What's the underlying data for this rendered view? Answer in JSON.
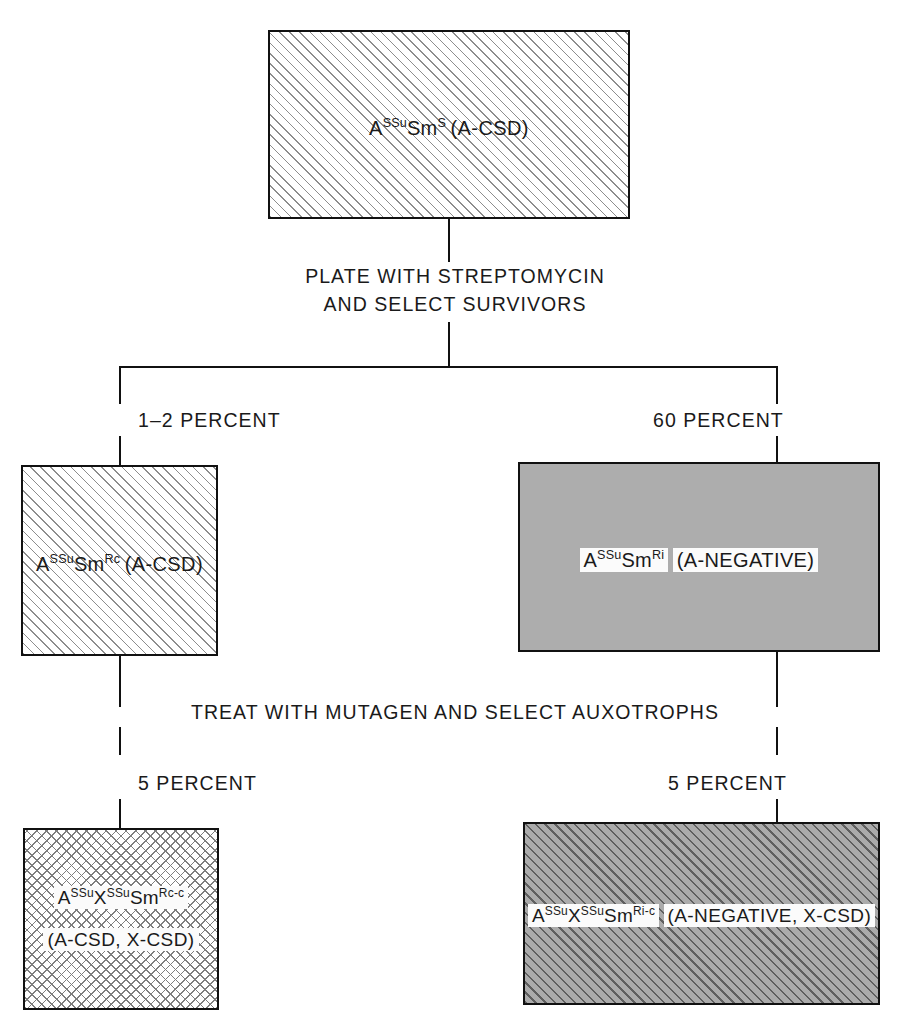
{
  "diagram": {
    "colors": {
      "line": "#111111",
      "hatch": "#8d8d8d",
      "gray_fill": "#adadad",
      "dark_hatch": "#5f5f5f",
      "text": "#1a1a1a"
    },
    "nodes": {
      "top": {
        "genotype_base": "A",
        "genotype_sup1": "SSu",
        "genotype_mid": "Sm",
        "genotype_sup2": "S",
        "phenotype": "(A-CSD)",
        "fill": "hatch"
      },
      "mid_left": {
        "genotype_base": "A",
        "genotype_sup1": "SSu",
        "genotype_mid": "Sm",
        "genotype_sup2": "Rc",
        "phenotype": "(A-CSD)",
        "fill": "hatch"
      },
      "mid_right": {
        "genotype_base": "A",
        "genotype_sup1": "SSu",
        "genotype_mid": "Sm",
        "genotype_sup2": "Ri",
        "phenotype": "(A-NEGATIVE)",
        "fill": "gray"
      },
      "bottom_left": {
        "genotype_base": "A",
        "genotype_sup1": "SSu",
        "genotype_x": "X",
        "genotype_sup2": "SSu",
        "genotype_mid": "Sm",
        "genotype_sup3": "Rc-c",
        "phenotype": "(A-CSD, X-CSD)",
        "fill": "cross-hatch"
      },
      "bottom_right": {
        "genotype_base": "A",
        "genotype_sup1": "SSu",
        "genotype_x": "X",
        "genotype_sup2": "SSu",
        "genotype_mid": "Sm",
        "genotype_sup3": "Ri-c",
        "phenotype": "(A-NEGATIVE, X-CSD)",
        "fill": "gray-hatch"
      }
    },
    "steps": {
      "step1": "PLATE WITH STREPTOMYCIN\nAND SELECT SURVIVORS",
      "step2": "TREAT WITH MUTAGEN AND SELECT AUXOTROPHS"
    },
    "percentages": {
      "left_branch": "1–2 PERCENT",
      "right_branch": "60 PERCENT",
      "bottom_left": "5 PERCENT",
      "bottom_right": "5 PERCENT"
    }
  }
}
